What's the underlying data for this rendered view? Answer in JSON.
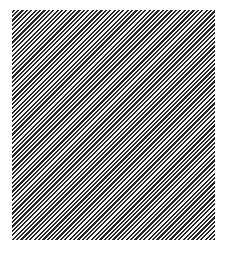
{
  "figure": {
    "type": "diagonal-stripe-pattern",
    "panel": {
      "x": 12,
      "y": 10,
      "width": 203,
      "height": 230
    },
    "stripes": {
      "direction": "rising-left-to-right",
      "angle_deg": 45,
      "period_px": 3.1,
      "dark_color": "#252525",
      "light_color": "#f4f4f4"
    },
    "background_color": "#ffffff"
  }
}
